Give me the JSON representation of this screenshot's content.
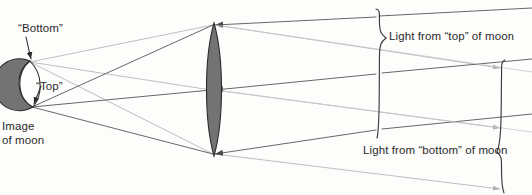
{
  "figure": {
    "background_color": "#fdfdfc",
    "ink_color": "#3a3a3a",
    "faint_ray_color": "#b4b4b4",
    "fill_gray": "#737373",
    "outline_color": "#2b2b2b"
  },
  "labels": {
    "bottom": "“Bottom”",
    "top": "“Top”",
    "image_of_moon": "Image\nof moon",
    "image_of_moon_line1": "Image",
    "image_of_moon_line2": "of moon",
    "light_from_top": "Light from “top” of moon",
    "light_from_bottom": "Light from “bottom” of moon"
  },
  "objects": {
    "moon_image": {
      "name": "image-of-moon",
      "shape": "gibbous-disc",
      "center_x": 18,
      "center_y": 84,
      "radius": 26,
      "fill": "#737373",
      "stroke": "#2b2b2b"
    },
    "lens": {
      "name": "converging-lens",
      "shape": "biconvex",
      "center_x": 214,
      "top_y": 23,
      "bottom_y": 156,
      "half_width": 11,
      "fill": "#737373",
      "stroke": "#2b2b2b"
    }
  },
  "ray_bundles": [
    {
      "name": "light-from-top-of-moon",
      "source_label": "“Top”",
      "source_point": {
        "x": 32,
        "y": 107
      },
      "tone": "dark",
      "color": "#4a4a4a",
      "arrow_direction": "leftward",
      "brace_side": "left",
      "caption": "Light from “top” of moon"
    },
    {
      "name": "light-from-bottom-of-moon",
      "source_label": "“Bottom”",
      "source_point": {
        "x": 30,
        "y": 62
      },
      "tone": "light",
      "color": "#b4b4b4",
      "arrow_direction": "leftward",
      "brace_side": "right",
      "caption": "Light from “bottom” of moon"
    }
  ],
  "braces": {
    "left": {
      "name": "brace-light-from-top",
      "x": 379,
      "y_top": 8,
      "y_bottom": 139,
      "tip_y": 38,
      "opens": "right"
    },
    "right": {
      "name": "brace-light-from-bottom",
      "x": 502,
      "y_top": 59,
      "y_bottom": 193,
      "tip_y": 152,
      "opens": "left"
    }
  },
  "annotation_arrows": [
    {
      "name": "bottom-callout-arrow",
      "from": {
        "x": 27,
        "y": 38
      },
      "to": {
        "x": 31,
        "y": 61
      }
    },
    {
      "name": "top-callout-arrow",
      "from": {
        "x": 40,
        "y": 87
      },
      "to": {
        "x": 33,
        "y": 107
      }
    }
  ]
}
